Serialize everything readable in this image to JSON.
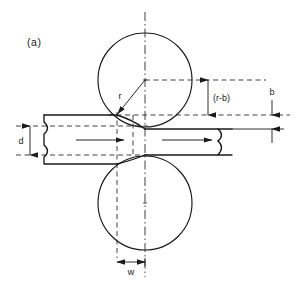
{
  "figure": {
    "panel_label": "(a)",
    "background_color": "#ffffff",
    "line_color": "#1a1a1a"
  },
  "labels": {
    "radius": "r",
    "roll_gap_offset": "(r-b)",
    "bite_height": "b",
    "strip_thickness": "d",
    "contact_width": "w"
  },
  "geometry": {
    "top_roll": {
      "cx": 145,
      "cy": 80,
      "r": 47
    },
    "bottom_roll": {
      "cx": 145,
      "cy": 203,
      "r": 47
    },
    "vertical_centerline": {
      "x": 145,
      "y1": 12,
      "y2": 277
    },
    "strip_entry": {
      "top_y": 115,
      "bottom_y": 164,
      "x_start": 44
    },
    "strip_exit": {
      "top_y": 129,
      "bottom_y": 155,
      "x_end": 232
    },
    "dim_d": {
      "x": 30,
      "y_top": 126,
      "y_bottom": 155
    },
    "dim_r_minus_b": {
      "x": 208,
      "y_top": 80,
      "y_bottom": 115
    },
    "dim_b": {
      "x": 272,
      "y_top": 115,
      "y_bottom": 129
    },
    "dim_w": {
      "y": 262,
      "x_left": 117,
      "x_right": 145
    }
  },
  "flow_arrows": [
    {
      "name": "entry-flow-arrow",
      "x1": 76,
      "x2": 124,
      "y": 140
    },
    {
      "name": "exit-flow-arrow",
      "x1": 162,
      "x2": 212,
      "y": 140
    }
  ]
}
